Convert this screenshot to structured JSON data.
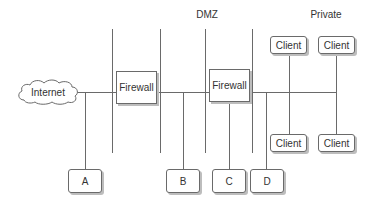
{
  "diagram": {
    "zones": [
      {
        "id": "dmz",
        "label": "DMZ"
      },
      {
        "id": "private",
        "label": "Private"
      }
    ],
    "nodes": {
      "internet": {
        "label": "Internet",
        "shape": "cloud"
      },
      "firewall1": {
        "label": "Firewall"
      },
      "firewall2": {
        "label": "Firewall"
      },
      "a": {
        "label": "A"
      },
      "b": {
        "label": "B"
      },
      "c": {
        "label": "C"
      },
      "d": {
        "label": "D"
      },
      "client1": {
        "label": "Client"
      },
      "client2": {
        "label": "Client"
      },
      "client3": {
        "label": "Client"
      },
      "client4": {
        "label": "Client"
      }
    },
    "edges": [
      [
        "internet",
        "firewall1"
      ],
      [
        "internet-segment",
        "a"
      ],
      [
        "firewall1",
        "firewall2"
      ],
      [
        "dmz-segment",
        "b"
      ],
      [
        "firewall2",
        "c"
      ],
      [
        "firewall2",
        "private-segment"
      ],
      [
        "private-segment",
        "d"
      ],
      [
        "private-segment",
        "client1"
      ],
      [
        "private-segment",
        "client2"
      ],
      [
        "private-segment",
        "client3"
      ],
      [
        "private-segment",
        "client4"
      ]
    ],
    "colors": {
      "line": "#6a6a6a",
      "shadow": "#bdbdbd",
      "text": "#333333"
    }
  }
}
